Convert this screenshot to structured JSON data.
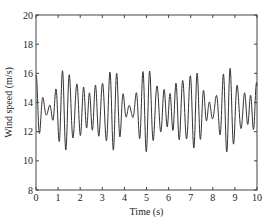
{
  "chart_data": {
    "type": "line",
    "title": "",
    "xlabel": "Time (s)",
    "ylabel": "Wind speed (m/s)",
    "xlim": [
      0,
      10
    ],
    "ylim": [
      8,
      20
    ],
    "xticks": [
      0,
      1,
      2,
      3,
      4,
      5,
      6,
      7,
      8,
      9,
      10
    ],
    "yticks": [
      8,
      10,
      12,
      14,
      16,
      18,
      20
    ],
    "xtick_labels": [
      "0",
      "1",
      "2",
      "3",
      "4",
      "5",
      "6",
      "7",
      "8",
      "9",
      "10"
    ],
    "ytick_labels": [
      "8",
      "10",
      "12",
      "14",
      "16",
      "18",
      "20"
    ],
    "grid": false,
    "legend": "none",
    "series": [
      {
        "name": "Wind speed",
        "color": "#333333",
        "model": {
          "description": "Oscillating wind speed, mean ~13.5 m/s, dominant ~3.3 Hz with beating; peaks ~14.2-16.7 m/s, troughs ~10.3-13 m/s",
          "mean": 13.5,
          "components": [
            {
              "amplitude": 1.6,
              "frequency_hz": 3.3,
              "phase": 1.57
            },
            {
              "amplitude": 0.9,
              "frequency_hz": 2.75,
              "phase": 0.4
            },
            {
              "amplitude": 0.45,
              "frequency_hz": 4.1,
              "phase": 2.1
            }
          ],
          "sample_step_s": 0.01
        },
        "peaks_approx": [
          16.6,
          15.4,
          15.1,
          16.5,
          16.1,
          14.8,
          15.6,
          16.7,
          15.8,
          14.6,
          16.4,
          16.4,
          15.3,
          15.2,
          16.6,
          16.3,
          14.4,
          16.1,
          16.5,
          15.9,
          14.6,
          16.3,
          16.3,
          15.2,
          15.7,
          16.5,
          16.3,
          14.6,
          15.8,
          16.6,
          16.1,
          14.3,
          16.3,
          16.2
        ],
        "troughs_approx": [
          11.0,
          12.3,
          11.2,
          10.3,
          11.9,
          10.6,
          10.7,
          12.1,
          10.4,
          10.9,
          12.5,
          10.6,
          10.6,
          12.4,
          10.5,
          10.4,
          11.6,
          11.3,
          10.4,
          12.0,
          10.4,
          10.6,
          12.2,
          10.6,
          10.7,
          12.6,
          10.5,
          10.3,
          12.0,
          10.5,
          10.5
        ]
      }
    ]
  }
}
